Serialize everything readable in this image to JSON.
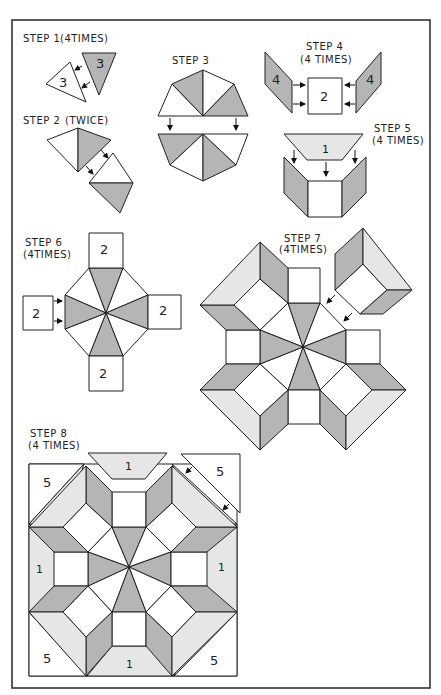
{
  "colors": {
    "dark_fabric": "#b5b5b5",
    "light_fabric": "#e6e6e6",
    "white_fabric": "#ffffff",
    "outline": "#222222"
  },
  "steps": [
    {
      "id": 1,
      "title": "STEP 1",
      "note": "(4TIMES)",
      "pieces": [
        "3",
        "3"
      ]
    },
    {
      "id": 2,
      "title": "STEP 2",
      "note": "(TWICE)"
    },
    {
      "id": 3,
      "title": "STEP 3",
      "note": ""
    },
    {
      "id": 4,
      "title": "STEP 4",
      "note": "(4 TIMES)",
      "pieces": [
        "4",
        "2",
        "4"
      ]
    },
    {
      "id": 5,
      "title": "STEP 5",
      "note": "(4 TIMES)",
      "pieces": [
        "1"
      ]
    },
    {
      "id": 6,
      "title": "STEP 6",
      "note": "(4TIMES)",
      "pieces": [
        "2",
        "2",
        "2",
        "2"
      ]
    },
    {
      "id": 7,
      "title": "STEP 7",
      "note": "(4TIMES)"
    },
    {
      "id": 8,
      "title": "STEP 8",
      "note": "(4 TIMES)",
      "pieces": [
        "1",
        "5",
        "5",
        "1",
        "1",
        "5",
        "1",
        "5"
      ]
    }
  ]
}
